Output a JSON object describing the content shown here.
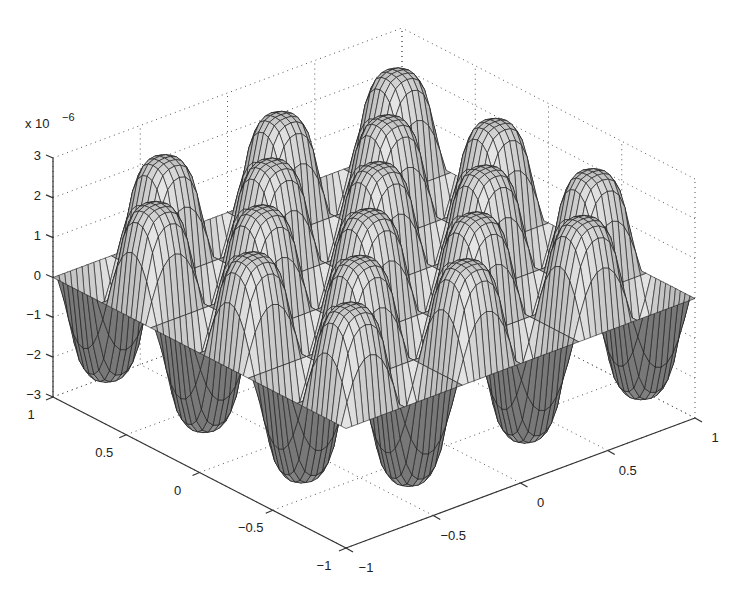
{
  "chart_data": {
    "type": "surface",
    "title": "",
    "xlabel": "",
    "ylabel": "",
    "zlabel": "",
    "z_scale_label": "x 10",
    "z_scale_exponent": "-6",
    "x_ticks": [
      "-1",
      "-0.5",
      "0",
      "0.5",
      "1"
    ],
    "y_ticks": [
      "-1",
      "-0.5",
      "0",
      "0.5",
      "1"
    ],
    "z_ticks": [
      "-3",
      "-2",
      "-1",
      "0",
      "1",
      "2",
      "3"
    ],
    "xlim": [
      -1,
      1
    ],
    "ylim": [
      -1,
      1
    ],
    "zlim": [
      -3e-06,
      3e-06
    ],
    "grid": true,
    "grid_style": "dotted",
    "surface_color": "#b8b8b8",
    "edge_color": "#1a1a1a"
  }
}
